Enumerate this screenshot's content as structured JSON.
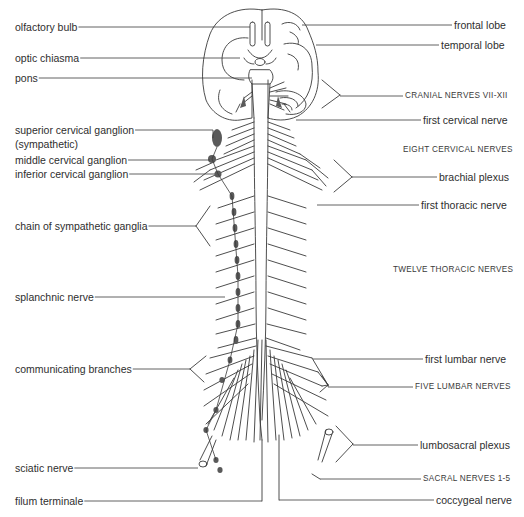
{
  "diagram": {
    "colors": {
      "line": "#3a3a3a",
      "ganglion": "#5a5a5a",
      "background": "#ffffff"
    },
    "left_labels": [
      {
        "id": "olfactory-bulb",
        "text": "olfactory bulb",
        "x": 15,
        "y": 21,
        "line_to": [
          250,
          27
        ]
      },
      {
        "id": "optic-chiasma",
        "text": "optic chiasma",
        "x": 15,
        "y": 52,
        "line_to": [
          240,
          58
        ]
      },
      {
        "id": "pons",
        "text": "pons",
        "x": 15,
        "y": 72,
        "line_to": [
          252,
          77
        ]
      },
      {
        "id": "superior-cervical-ganglion",
        "text": "superior cervical ganglion",
        "x": 15,
        "y": 124,
        "line_to": [
          213,
          138
        ]
      },
      {
        "id": "sympathetic",
        "text": "(sympathetic)",
        "x": 15,
        "y": 138,
        "line_to": null
      },
      {
        "id": "middle-cervical-ganglion",
        "text": "middle cervical ganglion",
        "x": 15,
        "y": 154,
        "line_to": [
          210,
          159
        ]
      },
      {
        "id": "inferior-cervical-ganglion",
        "text": "inferior cervical ganglion",
        "x": 15,
        "y": 168,
        "line_to": [
          215,
          174
        ]
      },
      {
        "id": "chain-of-sympathetic-ganglia",
        "text": "chain of sympathetic ganglia",
        "x": 15,
        "y": 220,
        "line_to": [
          196,
          226
        ]
      },
      {
        "id": "splanchnic-nerve",
        "text": "splanchnic nerve",
        "x": 15,
        "y": 291,
        "line_to": [
          225,
          296
        ]
      },
      {
        "id": "communicating-branches",
        "text": "communicating branches",
        "x": 15,
        "y": 363,
        "line_to": [
          190,
          369
        ]
      },
      {
        "id": "sciatic-nerve",
        "text": "sciatic nerve",
        "x": 15,
        "y": 462,
        "line_to": [
          198,
          468
        ]
      },
      {
        "id": "filum-terminale",
        "text": "filum terminale",
        "x": 15,
        "y": 495,
        "line_to": [
          262,
          501
        ]
      }
    ],
    "right_labels": [
      {
        "id": "frontal-lobe",
        "text": "frontal lobe",
        "x": 454,
        "y": 19,
        "line_to": [
          302,
          25
        ],
        "caps": false
      },
      {
        "id": "temporal-lobe",
        "text": "temporal lobe",
        "x": 441,
        "y": 39,
        "line_to": [
          316,
          46
        ],
        "caps": false
      },
      {
        "id": "cranial-nerves-vii-xii",
        "text": "CRANIAL NERVES VII-XII",
        "x": 405,
        "y": 90,
        "line_to": [
          340,
          95
        ],
        "caps": true
      },
      {
        "id": "first-cervical-nerve",
        "text": "first cervical nerve",
        "x": 423,
        "y": 114,
        "line_to": [
          296,
          119
        ],
        "caps": false
      },
      {
        "id": "eight-cervical-nerves",
        "text": "EIGHT CERVICAL NERVES",
        "x": 403,
        "y": 144,
        "line_to": null,
        "caps": true
      },
      {
        "id": "brachial-plexus",
        "text": "brachial plexus",
        "x": 439,
        "y": 171,
        "line_to": [
          352,
          177
        ],
        "caps": false
      },
      {
        "id": "first-thoracic-nerve",
        "text": "first thoracic nerve",
        "x": 421,
        "y": 199,
        "line_to": [
          317,
          204
        ],
        "caps": false
      },
      {
        "id": "twelve-thoracic-nerves",
        "text": "TWELVE THORACIC NERVES",
        "x": 393,
        "y": 264,
        "line_to": null,
        "caps": true
      },
      {
        "id": "first-lumbar-nerve",
        "text": "first lumbar nerve",
        "x": 425,
        "y": 353,
        "line_to": [
          313,
          358
        ],
        "caps": false
      },
      {
        "id": "five-lumbar-nerves",
        "text": "FIVE LUMBAR NERVES",
        "x": 415,
        "y": 381,
        "line_to": [
          328,
          385
        ],
        "caps": true
      },
      {
        "id": "lumbosacral-plexus",
        "text": "lumbosacral plexus",
        "x": 420,
        "y": 439,
        "line_to": [
          353,
          444
        ],
        "caps": false
      },
      {
        "id": "sacral-nerves-1-5",
        "text": "SACRAL NERVES 1-5",
        "x": 423,
        "y": 473,
        "line_to": [
          320,
          479
        ],
        "caps": true
      },
      {
        "id": "coccygeal-nerve",
        "text": "coccygeal nerve",
        "x": 436,
        "y": 494,
        "line_to": [
          279,
          500
        ],
        "caps": false
      }
    ]
  }
}
